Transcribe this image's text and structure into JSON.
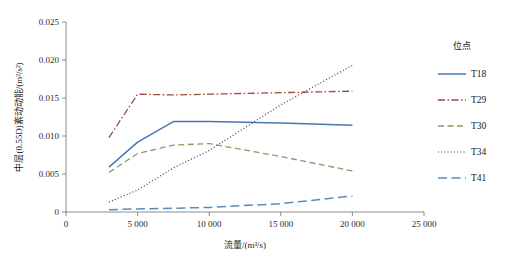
{
  "chart_data": {
    "type": "line",
    "title": "",
    "xlabel": "流量/(m³/s)",
    "ylabel": "中层(0.55D)紊动动能/(m²/s²)",
    "xlim": [
      0,
      25000
    ],
    "ylim": [
      0,
      0.025
    ],
    "xticks": [
      0,
      5000,
      10000,
      15000,
      20000,
      25000
    ],
    "xticklabels": [
      "0",
      "5 000",
      "10 000",
      "15 000",
      "20 000",
      "25 000"
    ],
    "yticks": [
      0,
      0.005,
      0.01,
      0.015,
      0.02,
      0.025
    ],
    "yticklabels": [
      "0",
      "0.005",
      "0.010",
      "0.015",
      "0.020",
      "0.025"
    ],
    "grid": false,
    "legend_position": "right",
    "legend_title": "位点",
    "x": [
      3000,
      5000,
      7500,
      10000,
      15000,
      20000
    ],
    "series": [
      {
        "name": "T18",
        "color": "#4a77b4",
        "dash": "none",
        "width": 1.5,
        "values": [
          0.0059,
          0.0092,
          0.0119,
          0.0119,
          0.0117,
          0.0114
        ]
      },
      {
        "name": "T29",
        "color": "#9c4a3c",
        "dash": "dashdot",
        "width": 1.3,
        "values": [
          0.0098,
          0.0155,
          0.0154,
          0.0155,
          0.0157,
          0.0159
        ]
      },
      {
        "name": "T30",
        "color": "#8a9a63",
        "dash": "dashed",
        "width": 1.3,
        "values": [
          0.0052,
          0.0077,
          0.0088,
          0.009,
          0.0073,
          0.0054
        ]
      },
      {
        "name": "T34",
        "color": "#3d3d3d",
        "dash": "dotted",
        "width": 1.2,
        "values": [
          0.0013,
          0.0029,
          0.0058,
          0.0081,
          0.0141,
          0.0193
        ]
      },
      {
        "name": "T41",
        "color": "#5b89bd",
        "dash": "longdash",
        "width": 1.5,
        "values": [
          0.0003,
          0.0004,
          0.0005,
          0.0006,
          0.0011,
          0.0021
        ]
      }
    ]
  },
  "figure": {
    "caption": ""
  }
}
